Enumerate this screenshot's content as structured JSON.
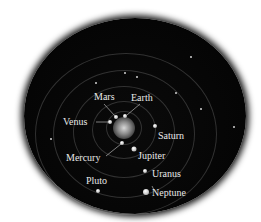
{
  "diagram": {
    "title": "",
    "center": {
      "name": "Sun",
      "x": 124,
      "y": 128
    },
    "planets": [
      {
        "name": "Mercury",
        "label": "Mercury",
        "x": 122,
        "y": 143,
        "size": 4
      },
      {
        "name": "Venus",
        "label": "Venus",
        "x": 110,
        "y": 122,
        "size": 4
      },
      {
        "name": "Earth",
        "label": "Earth",
        "x": 125,
        "y": 116,
        "size": 4
      },
      {
        "name": "Mars",
        "label": "Mars",
        "x": 116,
        "y": 117,
        "size": 4
      },
      {
        "name": "Jupiter",
        "label": "Jupiter",
        "x": 134,
        "y": 149,
        "size": 5
      },
      {
        "name": "Saturn",
        "label": "Saturn",
        "x": 155,
        "y": 126,
        "size": 4
      },
      {
        "name": "Uranus",
        "label": "Uranus",
        "x": 145,
        "y": 171,
        "size": 4
      },
      {
        "name": "Neptune",
        "label": "Neptune",
        "x": 146,
        "y": 192,
        "size": 6
      },
      {
        "name": "Pluto",
        "label": "Pluto",
        "x": 98,
        "y": 191,
        "size": 4
      }
    ],
    "colors": {
      "background": "#000000",
      "labels": "#e8e8e8",
      "page": "#ffffff"
    }
  }
}
